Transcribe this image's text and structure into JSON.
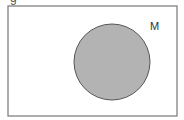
{
  "diagram": {
    "type": "venn",
    "clipped_title_fragment": "g",
    "universe": {
      "x": 8,
      "y": 6,
      "width": 169,
      "height": 110,
      "stroke": "#777777",
      "fill": "#ffffff"
    },
    "sets": [
      {
        "label": "M",
        "cx": 112,
        "cy": 62,
        "r": 38,
        "fill": "#b3b3b3",
        "stroke": "#555555",
        "shaded": true,
        "label_pos": {
          "x": 150,
          "y": 30
        }
      }
    ]
  }
}
